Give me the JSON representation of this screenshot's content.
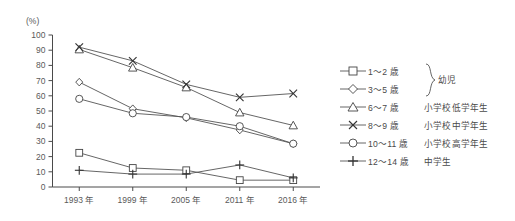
{
  "chart_data": {
    "type": "line",
    "title": "",
    "xlabel": "",
    "ylabel": "(%)",
    "unit_label": "(%)",
    "categories": [
      "1993 年",
      "1999 年",
      "2005 年",
      "2011 年",
      "2016 年"
    ],
    "yticks": [
      0,
      10,
      20,
      30,
      40,
      50,
      60,
      70,
      80,
      90,
      100
    ],
    "ylim": [
      0,
      100
    ],
    "grid": false,
    "legend_position": "right",
    "series": [
      {
        "name": "1〜2 歳",
        "group": "幼児",
        "marker": "square",
        "values": [
          22.5,
          12.5,
          11.0,
          4.5,
          4.5
        ]
      },
      {
        "name": "3〜5 歳",
        "group": "幼児",
        "marker": "diamond",
        "values": [
          69.0,
          51.5,
          45.5,
          37.5,
          28.5
        ]
      },
      {
        "name": "6〜7 歳",
        "group": "小学校低学年生",
        "marker": "triangle",
        "values": [
          90.5,
          78.5,
          65.5,
          49.0,
          40.5
        ]
      },
      {
        "name": "8〜9 歳",
        "group": "小学校中学年生",
        "marker": "cross-x",
        "values": [
          92.0,
          83.0,
          67.5,
          59.0,
          61.5
        ]
      },
      {
        "name": "10〜11 歳",
        "group": "小学校高学年生",
        "marker": "circle",
        "values": [
          58.0,
          48.5,
          46.0,
          40.0,
          28.5
        ]
      },
      {
        "name": "12〜14 歳",
        "group": "中学生",
        "marker": "plus",
        "values": [
          11.0,
          8.5,
          8.5,
          14.5,
          6.0
        ]
      }
    ]
  },
  "legend": {
    "group_brace_label": "幼児",
    "rows": [
      {
        "age": "1〜2 歳",
        "desc": ""
      },
      {
        "age": "3〜5 歳",
        "desc": ""
      },
      {
        "age": "6〜7 歳",
        "desc": "小学校低学年生"
      },
      {
        "age": "8〜9 歳",
        "desc": "小学校中学年生"
      },
      {
        "age": "10〜11 歳",
        "desc": "小学校高学年生"
      },
      {
        "age": "12〜14 歳",
        "desc": "中学生"
      }
    ]
  },
  "colors": {
    "line": "#555555",
    "axis": "#4a4a4a",
    "text": "#4a4a4a",
    "background": "#ffffff"
  }
}
